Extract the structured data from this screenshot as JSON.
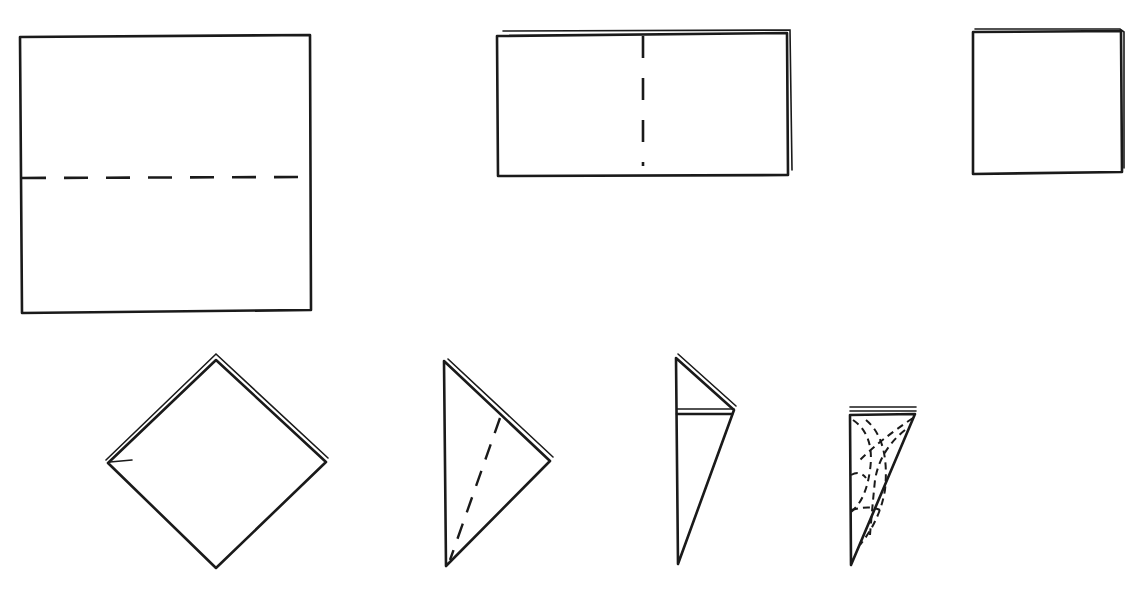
{
  "diagram": {
    "type": "paper-folding-instructions",
    "steps": [
      {
        "id": 1,
        "shape": "square",
        "fold": "horizontal dashed fold line (fold in half)"
      },
      {
        "id": 2,
        "shape": "rectangle (folded in half)",
        "fold": "vertical dashed fold line (fold in half again)"
      },
      {
        "id": 3,
        "shape": "small square (folded in quarters)",
        "fold": "none"
      },
      {
        "id": 4,
        "shape": "diamond (square rotated 45°)",
        "fold": "none"
      },
      {
        "id": 5,
        "shape": "triangle",
        "fold": "diagonal dashed fold line"
      },
      {
        "id": 6,
        "shape": "narrow folded triangle",
        "fold": "top flap folded"
      },
      {
        "id": 7,
        "shape": "narrow triangle with cut pattern",
        "fold": "dashed curved cut lines"
      }
    ],
    "colors": {
      "line": "#1a1a1a",
      "background": "#ffffff"
    }
  }
}
